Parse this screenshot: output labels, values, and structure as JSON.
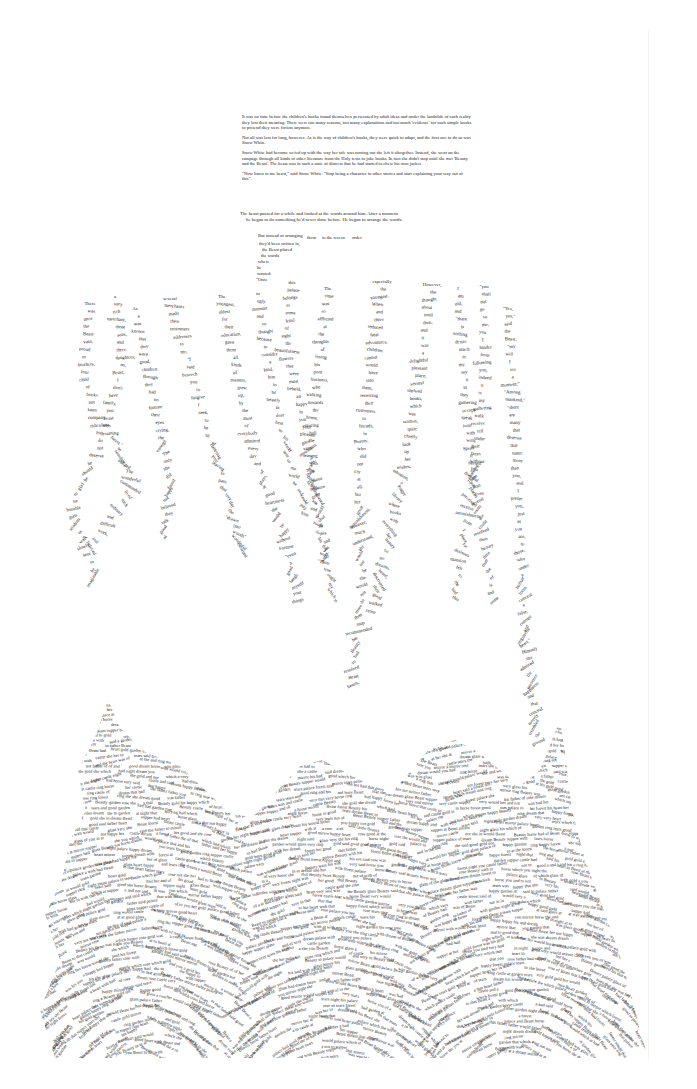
{
  "intro": {
    "paragraphs": [
      "It was no time before the children's books found themselves persecuted by adult ideas and under the landslide of such reality they lost their meaning. There were too many reasons, too many explanations and too much 'evidence' for such simple books to pretend they were fiction anymore.",
      "Not all was lost for long, however. As is the way of children's books, they were quick to adapt, and the first one to do so was Snow White.",
      "Snow White had become so fed up with the way her tale was turning out she left it altogether. Instead, she went on the rampage through all kinds of other literature from the Holy texts to joke books. In fact she didn't stop until she met 'Beauty and the Beast'. The beast was in such a state of distress that he had started to chew his own jacket.",
      "\"Now listen to me beast,\" said Snow White. \"Stop being a character in other stories and start explaining your way out of this\"."
    ]
  },
  "beast": {
    "line1": "The beast paused for a while and looked at the words around him. After a moment",
    "line2": "he began to do something he'd never done before. He began to arrange the words."
  },
  "arranged_words": [
    {
      "text": "But instead of arranging",
      "x": 258,
      "y": 233
    },
    {
      "text": "them",
      "x": 307,
      "y": 235
    },
    {
      "text": "in the recent",
      "x": 322,
      "y": 235
    },
    {
      "text": "order",
      "x": 352,
      "y": 235
    },
    {
      "text": "they'd been written in,",
      "x": 259,
      "y": 241
    },
    {
      "text": "the Beast placed",
      "x": 262,
      "y": 247
    },
    {
      "text": "the words",
      "x": 261,
      "y": 253
    },
    {
      "text": "where",
      "x": 258,
      "y": 259
    },
    {
      "text": "he",
      "x": 257,
      "y": 265
    },
    {
      "text": "wanted.",
      "x": 257,
      "y": 271
    },
    {
      "text": "\"Once",
      "x": 256,
      "y": 277
    }
  ],
  "columns": [
    {
      "x": 90,
      "y": 305,
      "drift": [
        0,
        -2,
        4,
        -6,
        2
      ],
      "angle": 0,
      "words": [
        "There",
        "was",
        "once",
        "the",
        "Beast",
        "vain,",
        "proud",
        "or",
        "brothers,",
        "four",
        "child",
        "of",
        "books",
        "not",
        "keen",
        "company",
        "ridiculous",
        "for",
        "do",
        "not",
        "deserve",
        "he",
        "should",
        "be",
        "glad",
        "to",
        "be",
        "humble",
        "their",
        "wisdom",
        "to",
        "walk",
        "slowly",
        "sent",
        "to",
        "be",
        "imaginable"
      ]
    },
    {
      "x": 115,
      "y": 298,
      "drift": [
        0,
        3,
        -3,
        6,
        -8
      ],
      "angle": 0,
      "words": [
        "a",
        "very",
        "rich",
        "merchant,",
        "three",
        "sons,",
        "and",
        "three",
        "daughters;",
        "no,",
        "Beast,",
        "I",
        "don't",
        "have",
        "family,",
        "you",
        "beast",
        "who",
        "dreaming",
        "forest.\"",
        "so",
        "sensibly",
        "obliged",
        "The",
        "wonderful",
        "commanded",
        "lived",
        "such",
        "ordinary",
        "and",
        "difficult",
        "work,",
        "and",
        "beloved"
      ]
    },
    {
      "x": 135,
      "y": 310,
      "drift": [
        0,
        4,
        8,
        12,
        10
      ],
      "angle": 0,
      "words": [
        "As",
        "a",
        "was",
        "known",
        "that",
        "they",
        "were",
        "good,",
        "children",
        "through",
        "they",
        "had",
        "no",
        "fortune",
        "their",
        "eyes",
        "crying,",
        "the",
        "enough",
        "The",
        "only",
        "she",
        "did",
        "found",
        "happy",
        "not",
        "beloved",
        "they",
        "talk",
        "good",
        "of"
      ]
    },
    {
      "x": 170,
      "y": 300,
      "drift": [
        0,
        6,
        12,
        18,
        24
      ],
      "angle": 0,
      "words": [
        "several",
        "merchants",
        "made",
        "their",
        "customers",
        "addresses",
        "to",
        "me,",
        "\"I",
        "said",
        "beseech",
        "you",
        "to",
        "forgive",
        "I",
        "seek,",
        "to",
        "be",
        "by",
        "of",
        "flattering",
        "your",
        "leaving",
        "to",
        "pass",
        "that",
        "very",
        "day",
        "the",
        "\"drawn",
        "into",
        "woods\"",
        "wonderful",
        "crowned"
      ]
    },
    {
      "x": 222,
      "y": 298,
      "drift": [
        0,
        5,
        10,
        20,
        26
      ],
      "angle": 0,
      "words": [
        "The",
        "youngest,",
        "eldest",
        "for",
        "their",
        "education,",
        "gave",
        "them",
        "all",
        "kinds",
        "of",
        "masters,",
        "grew",
        "up,",
        "by",
        "the",
        "most",
        "of",
        "everybody",
        "admired",
        "every",
        "day",
        "and",
        "of",
        "plays,",
        "at",
        "good",
        "heartiness",
        "she",
        "would",
        "be",
        "happy",
        "without",
        "Fortune",
        "\"even",
        "a",
        "good",
        "laugh",
        "myself",
        "your",
        "things"
      ]
    },
    {
      "x": 258,
      "y": 295,
      "drift": [
        0,
        3,
        6,
        10,
        16
      ],
      "angle": 0,
      "words": [
        "to",
        "ugly",
        "monster",
        "and",
        "so",
        "thought",
        "because",
        "to",
        "consider",
        "a",
        "kind,",
        "him",
        "to",
        "be",
        "beastly",
        "in",
        "dear",
        "heat",
        "to",
        "his",
        "would",
        "sent",
        "to",
        "me",
        "world",
        "he",
        "and",
        "could",
        "pity",
        "him"
      ]
    },
    {
      "x": 292,
      "y": 284,
      "drift": [
        0,
        -2,
        4,
        8,
        12
      ],
      "angle": 0,
      "words": [
        "this",
        "palace",
        "belongs",
        "to",
        "some",
        "kind",
        "of",
        "sight",
        "the",
        "beautifulness",
        "flowers",
        "that",
        "were",
        "most",
        "beheld,",
        "all",
        "happy",
        "in",
        "you",
        "your",
        "pleasant",
        "gaze",
        "mountains",
        "of",
        "dwarfs,",
        "their",
        "glorious",
        "treasure",
        "gone",
        "a",
        "would",
        "shut",
        "all",
        "this",
        "and",
        "was",
        "pages."
      ]
    },
    {
      "x": 328,
      "y": 290,
      "drift": [
        0,
        -3,
        -6,
        -4,
        2
      ],
      "angle": 0,
      "words": [
        "The",
        "time",
        "was",
        "so",
        "afflicted",
        "at",
        "the",
        "thoughts",
        "of",
        "losing",
        "his",
        "poor",
        "business,",
        "who",
        "walking",
        "towards",
        "the",
        "home,",
        "entering",
        "hall",
        "the",
        "same",
        "leaving",
        "with",
        "the",
        "door",
        "hold,",
        "remembered",
        "an",
        "and",
        "at",
        "room",
        "in",
        "his",
        "the",
        "walls",
        "\"Thou",
        "true",
        "ought",
        "my",
        "which",
        "is"
      ]
    },
    {
      "x": 382,
      "y": 283,
      "drift": [
        0,
        -4,
        -8,
        -6,
        -10
      ],
      "angle": 0,
      "words": [
        "especially",
        "the",
        "youngest.",
        "When",
        "and",
        "three",
        "reduced",
        "fatal",
        "adventures,",
        "children",
        "cannot",
        "would",
        "have",
        "into",
        "them,",
        "receiving",
        "their",
        "customers",
        "to",
        "friends,",
        "in",
        "Beauty,",
        "who",
        "did",
        "not",
        "cry",
        "at",
        "all,",
        "but",
        "her",
        "great",
        "astonishment,",
        "however,",
        "much",
        "understand,",
        "she",
        "would",
        "not",
        "be",
        "she",
        "would",
        "not",
        "do",
        "more",
        "than",
        "stop",
        "recommended",
        "her",
        "Beauty",
        "had",
        "so",
        "resolved",
        "Beast",
        "hearts,"
      ]
    },
    {
      "x": 432,
      "y": 286,
      "drift": [
        0,
        -4,
        -8,
        -14,
        -20
      ],
      "angle": 0,
      "words": [
        "However,",
        "she",
        "thought",
        "about",
        "until",
        "then,",
        "and",
        "it",
        "was",
        "a",
        "delightful",
        "pleasant",
        "place,",
        "several",
        "shelved",
        "books,",
        "which",
        "was",
        "written,",
        "quite",
        "chiefly",
        "look",
        "up",
        "her",
        "wishes,",
        "attention,",
        "a",
        "longer",
        "library",
        "where",
        "books",
        "with",
        "everything",
        "her",
        "beauty",
        "so",
        "no",
        "dreams,",
        "heard,",
        "discovered",
        "their",
        "good",
        "walked",
        "stone"
      ]
    },
    {
      "x": 458,
      "y": 290,
      "drift": [
        0,
        2,
        4,
        8,
        12
      ],
      "angle": 0,
      "words": [
        "I",
        "am",
        "old,",
        "and",
        "\"there",
        "is",
        "nothing",
        "desire",
        "much",
        "to",
        "my",
        "say",
        "it",
        "to",
        "they",
        "gathering",
        "occupy",
        "speak",
        "your",
        "with",
        "wills",
        "Speak",
        "it",
        "herself",
        "chalking",
        "There",
        "than",
        "lives",
        "several",
        "room",
        "she",
        "could",
        "resolved",
        "their",
        "beauty",
        "time",
        "than",
        "the",
        "of",
        "is",
        "and",
        "some"
      ]
    },
    {
      "x": 484,
      "y": 288,
      "drift": [
        0,
        0,
        -2,
        -6,
        -10
      ],
      "angle": 0,
      "words": [
        "\"you",
        "shall",
        "not",
        "go",
        "so",
        "me,",
        "you",
        "I",
        "hinder",
        "from",
        "following",
        "you,",
        "indeed",
        "it",
        "is",
        "my",
        "gathering",
        "walk",
        "receive",
        "tell",
        "under",
        "their",
        "faces",
        "without",
        "you",
        "dreadful",
        "you",
        "places",
        "perceived",
        "receive",
        "astonishment,",
        "from",
        "I",
        "place",
        "for",
        "desirous",
        "mansion",
        "felt",
        "to",
        "the",
        "bed",
        "this"
      ]
    },
    {
      "x": 508,
      "y": 310,
      "drift": [
        0,
        2,
        4,
        6,
        10
      ],
      "angle": 0,
      "words": [
        "\"Yes,",
        "yes,\"",
        "said",
        "the",
        "Beast,",
        "\"my",
        "will",
        "I",
        "see",
        "a",
        "moment;\"",
        "\"Among",
        "mankind,\"",
        "\"there",
        "are",
        "many",
        "that",
        "deserve",
        "that",
        "name",
        "more",
        "than",
        "you,",
        "and",
        "I",
        "prefer",
        "you,",
        "just",
        "as",
        "you",
        "are,",
        "to",
        "those,",
        "who",
        "under",
        "a",
        "human",
        "form,",
        "conceal",
        "a",
        "false,",
        "corrupt",
        "and",
        "ungrateful",
        "heart.\"",
        "Himself",
        "she",
        "admired",
        "the",
        "presence",
        "happiness",
        "and",
        "that",
        "conceal",
        "merely",
        "trembled",
        "the",
        "ground"
      ]
    }
  ],
  "root_mass": {
    "description": "Dense mass of cut-out printed text strips forming roots/mountain shape",
    "sample_words": [
      "a",
      "the",
      "and",
      "of",
      "to",
      "she",
      "her",
      "Beast",
      "said",
      "with",
      "was",
      "had",
      "his",
      "at",
      "in",
      "you",
      "would",
      "that",
      "which",
      "not",
      "very",
      "good",
      "Beauty",
      "father",
      "palace",
      "happy",
      "rose",
      "garden",
      "dream",
      "heart",
      "night",
      "tears",
      "castle",
      "supper",
      "horse",
      "forest",
      "gold",
      "mirror",
      "ring",
      "glass"
    ]
  },
  "colors": {
    "background": "#ffffff",
    "ink": "#1c1c1c",
    "sheet_edge": "#f2f2f2"
  }
}
